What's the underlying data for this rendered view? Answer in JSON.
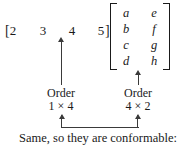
{
  "figure": {
    "row_vector": {
      "open_bracket": "[",
      "close_bracket": "]",
      "entries": [
        "2",
        "3",
        "4",
        "5"
      ]
    },
    "matrix": {
      "rows": [
        [
          "a",
          "e"
        ],
        [
          "b",
          "f"
        ],
        [
          "c",
          "g"
        ],
        [
          "d",
          "h"
        ]
      ]
    },
    "labels": {
      "left": {
        "title": "Order",
        "dims": "1 × 4"
      },
      "right": {
        "title": "Order",
        "dims": "4 × 2"
      }
    },
    "caption": "Same, so they are conformable:",
    "colors": {
      "background": "#ffffff",
      "text": "#1a1a1a",
      "arrow": "#3a3a3a"
    }
  }
}
